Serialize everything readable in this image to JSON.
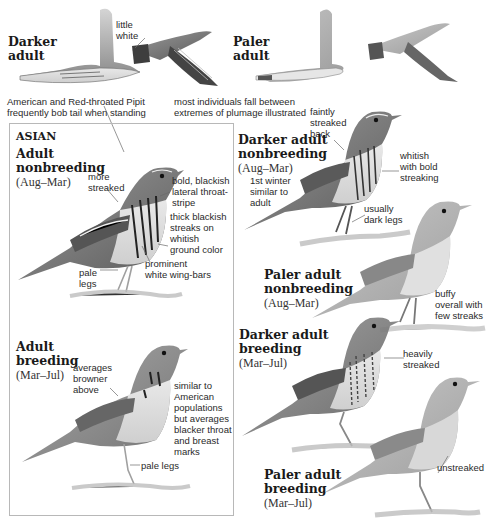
{
  "header": {
    "darker_adult_flight": {
      "title_line1": "Darker",
      "title_line2": "adult"
    },
    "paler_adult_flight": {
      "title_line1": "Paler",
      "title_line2": "adult"
    },
    "flight_note": {
      "line1": "little",
      "line2": "white"
    },
    "caption_left": {
      "line1": "American and Red-throated Pipit",
      "line2": "frequently bob tail when standing"
    },
    "caption_right": {
      "line1": "most individuals fall between",
      "line2": "extremes of plumage illustrated"
    }
  },
  "asian_box": {
    "heading": "ASIAN",
    "nonbreeding": {
      "title_line1": "Adult",
      "title_line2": "nonbreeding",
      "season": "(Aug–Mar)",
      "notes": [
        {
          "line1": "more",
          "line2": "streaked"
        },
        {
          "line1": "bold, blackish",
          "line2": "lateral throat-",
          "line3": "stripe"
        },
        {
          "line1": "thick blackish",
          "line2": "streaks on",
          "line3": "whitish",
          "line4": "ground color"
        },
        {
          "line1": "prominent",
          "line2": "white wing-bars"
        },
        {
          "line1": "pale",
          "line2": "legs"
        }
      ]
    },
    "breeding": {
      "title_line1": "Adult",
      "title_line2": "breeding",
      "season": "(Mar–Jul)",
      "notes": [
        {
          "line1": "averages",
          "line2": "browner",
          "line3": "above"
        },
        {
          "line1": "similar to",
          "line2": "American",
          "line3": "populations",
          "line4": "but averages",
          "line5": "blacker throat",
          "line6": "and breast",
          "line7": "marks"
        },
        {
          "line1": "pale legs"
        }
      ]
    }
  },
  "right_column": {
    "darker_nonbreeding": {
      "title_line1": "Darker adult",
      "title_line2": "nonbreeding",
      "season": "(Aug–Mar)",
      "notes": [
        {
          "line1": "faintly",
          "line2": "streaked",
          "line3": "back"
        },
        {
          "line1": "whitish",
          "line2": "with bold",
          "line3": "streaking"
        },
        {
          "line1": "1st winter",
          "line2": "similar to",
          "line3": "adult"
        },
        {
          "line1": "usually",
          "line2": "dark legs"
        }
      ]
    },
    "paler_nonbreeding": {
      "title_line1": "Paler adult",
      "title_line2": "nonbreeding",
      "season": "(Aug–Mar)",
      "notes": [
        {
          "line1": "buffy",
          "line2": "overall with",
          "line3": "few streaks"
        }
      ]
    },
    "darker_breeding": {
      "title_line1": "Darker adult",
      "title_line2": "breeding",
      "season": "(Mar–Jul)",
      "notes": [
        {
          "line1": "heavily",
          "line2": "streaked"
        }
      ]
    },
    "paler_breeding": {
      "title_line1": "Paler adult",
      "title_line2": "breeding",
      "season": "(Mar–Jul)",
      "notes": [
        {
          "line1": "unstreaked"
        }
      ]
    }
  },
  "colors": {
    "text": "#1a1a1a",
    "box_border": "#b8b8b8",
    "bird_dark": "#4a4a4a",
    "bird_mid": "#8a8a8a",
    "bird_light": "#c8c8c8"
  }
}
